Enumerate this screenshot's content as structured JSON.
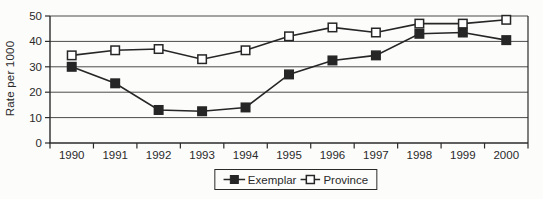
{
  "chart_data": {
    "type": "line",
    "title": "",
    "xlabel": "",
    "ylabel": "Rate per 1000",
    "ylim": [
      0,
      50
    ],
    "yticks": [
      0,
      10,
      20,
      30,
      40,
      50
    ],
    "grid": "horizontal",
    "legend_position": "bottom",
    "categories": [
      "1990",
      "1991",
      "1992",
      "1993",
      "1994",
      "1995",
      "1996",
      "1997",
      "1998",
      "1999",
      "2000"
    ],
    "series": [
      {
        "name": "Exemplar",
        "marker": "filled-square",
        "values": [
          30,
          23.5,
          13,
          12.5,
          14,
          27,
          32.5,
          34.5,
          43,
          43.5,
          40.5
        ]
      },
      {
        "name": "Province",
        "marker": "open-square",
        "values": [
          34.5,
          36.5,
          37,
          33,
          36.5,
          42,
          45.5,
          43.5,
          47,
          47,
          48.5
        ]
      }
    ]
  },
  "colors": {
    "line": "#262626",
    "grid": "#4a4a4a",
    "axis": "#2b2b2b",
    "text": "#2a2a2a",
    "marker_open_fill": "#ffffff",
    "background": "#fcfcfb"
  }
}
